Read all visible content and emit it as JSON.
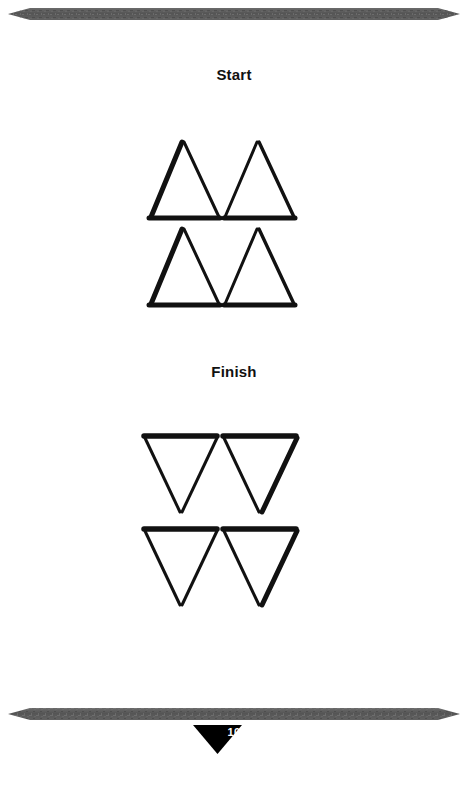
{
  "page": {
    "number": "10",
    "background_color": "#ffffff",
    "ink_color": "#000000",
    "rule_color": "#5a5a5a"
  },
  "rules": {
    "top": {
      "name": "spear-rule-top"
    },
    "bottom": {
      "name": "spear-rule-bottom"
    }
  },
  "puzzle": {
    "start": {
      "label": "Start",
      "description": "Four upward-pointing triangles arranged in two rows of two, sharing bases",
      "triangles": [
        {
          "row": 1,
          "col": 1,
          "orientation": "up"
        },
        {
          "row": 1,
          "col": 2,
          "orientation": "up"
        },
        {
          "row": 2,
          "col": 1,
          "orientation": "up"
        },
        {
          "row": 2,
          "col": 2,
          "orientation": "up"
        }
      ]
    },
    "finish": {
      "label": "Finish",
      "description": "Four downward-pointing triangles arranged in two rows of two, sharing top edges",
      "triangles": [
        {
          "row": 1,
          "col": 1,
          "orientation": "down"
        },
        {
          "row": 1,
          "col": 2,
          "orientation": "down"
        },
        {
          "row": 2,
          "col": 1,
          "orientation": "down"
        },
        {
          "row": 2,
          "col": 2,
          "orientation": "down"
        }
      ]
    }
  }
}
